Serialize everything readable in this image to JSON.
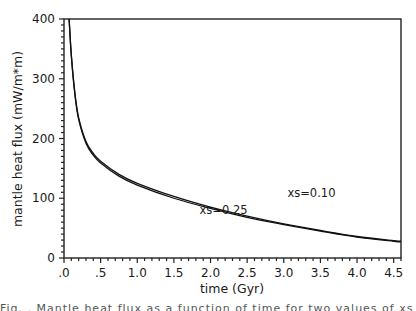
{
  "chart_data": {
    "type": "line",
    "title": "",
    "xlabel": "time (Gyr)",
    "ylabel": "mantle heat flux (mW/m*m)",
    "xlim": [
      0.0,
      4.6
    ],
    "ylim": [
      0,
      400
    ],
    "grid": false,
    "x_ticks": [
      ".0",
      ".5",
      "1.0",
      "1.5",
      "2.0",
      "2.5",
      "3.0",
      "3.5",
      "4.0",
      "4.5"
    ],
    "x_tick_values": [
      0.0,
      0.5,
      1.0,
      1.5,
      2.0,
      2.5,
      3.0,
      3.5,
      4.0,
      4.5
    ],
    "y_ticks": [
      "0",
      "100",
      "200",
      "300",
      "400"
    ],
    "y_tick_values": [
      0,
      100,
      200,
      300,
      400
    ],
    "series": [
      {
        "name": "xs=0.10",
        "x": [
          0.07,
          0.1,
          0.15,
          0.2,
          0.3,
          0.4,
          0.5,
          0.75,
          1.0,
          1.5,
          2.0,
          2.5,
          3.0,
          3.5,
          4.0,
          4.5,
          4.6
        ],
        "values": [
          400,
          340,
          275,
          235,
          195,
          175,
          162,
          140,
          125,
          103,
          85,
          70,
          57,
          46,
          36,
          29,
          28
        ]
      },
      {
        "name": "xs=0.25",
        "x": [
          0.07,
          0.1,
          0.15,
          0.2,
          0.3,
          0.4,
          0.5,
          0.75,
          1.0,
          1.5,
          2.0,
          2.5,
          3.0,
          3.5,
          4.0,
          4.5,
          4.6
        ],
        "values": [
          400,
          338,
          272,
          232,
          192,
          172,
          159,
          137,
          122,
          100,
          83,
          68,
          56,
          45,
          35,
          28,
          27
        ]
      }
    ],
    "annotations": [
      {
        "text": "xs=0.10",
        "x": 3.05,
        "y": 102
      },
      {
        "text": "xs=0.25",
        "x": 1.85,
        "y": 73
      }
    ],
    "legend": "none (inline annotations)"
  },
  "caption_fragment": "Fig. . Mantle heat flux as a function of time for two values of xs"
}
